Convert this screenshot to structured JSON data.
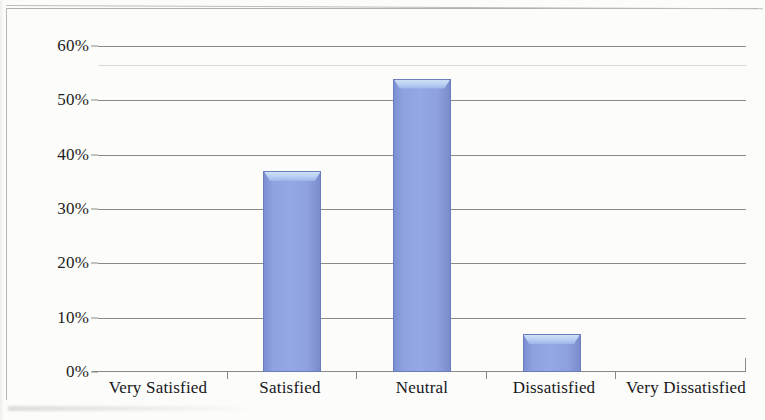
{
  "chart_data": {
    "type": "bar",
    "title": "",
    "subtitle": "",
    "xlabel": "",
    "ylabel": "",
    "categories": [
      "Very Satisfied",
      "Satisfied",
      "Neutral",
      "Dissatisfied",
      "Very Dissatisfied"
    ],
    "values": [
      0,
      37,
      54,
      7,
      0
    ],
    "value_labels": [
      "0%",
      "37%",
      "54%",
      "7%",
      "0%"
    ],
    "ylim": [
      0,
      60
    ],
    "ytick_values": [
      0,
      10,
      20,
      30,
      40,
      50,
      60
    ],
    "ytick_labels": [
      "0%",
      "10%",
      "20%",
      "30%",
      "40%",
      "50%",
      "60%"
    ],
    "grid": true,
    "grid_axis": "y",
    "legend": false,
    "legend_position": "none",
    "bar_color": "#8ea2e0",
    "bar_edge_color": "#6c7cbb",
    "bar_highlight_color": "#cfe0f7",
    "axis_color": "#8a8a85",
    "background_color": "#fcfcfa",
    "text_color": "#1d1d1b"
  }
}
